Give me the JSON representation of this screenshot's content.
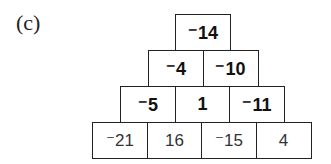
{
  "label": "(c)",
  "pyramid": {
    "rows": [
      {
        "style": "bold",
        "cells": [
          "⁻14"
        ]
      },
      {
        "style": "bold",
        "cells": [
          "⁻4",
          "⁻10"
        ]
      },
      {
        "style": "bold",
        "cells": [
          "⁻5",
          "1",
          "⁻11"
        ]
      },
      {
        "style": "normal",
        "cells": [
          "⁻21",
          "16",
          "⁻15",
          "4"
        ]
      }
    ]
  }
}
